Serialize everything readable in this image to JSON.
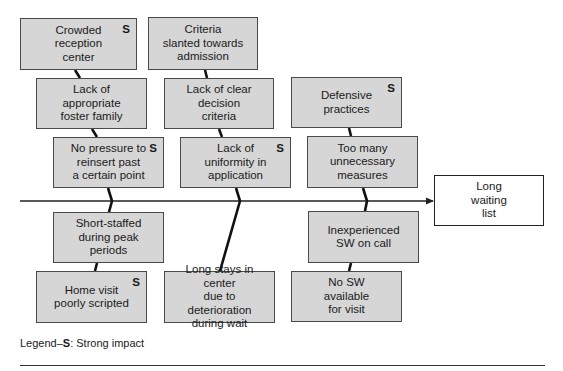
{
  "diagram": {
    "type": "fishbone",
    "effect": {
      "label": "Long\nwaiting\nlist",
      "x": 434,
      "y": 175,
      "w": 110,
      "h": 51
    },
    "causes": [
      {
        "id": "crowded",
        "label": "Crowded\nreception\ncenter",
        "strong": true,
        "x": 20,
        "y": 18,
        "w": 117,
        "h": 52
      },
      {
        "id": "criteria",
        "label": "Criteria\nslanted towards\nadmission",
        "strong": false,
        "x": 148,
        "y": 17,
        "w": 110,
        "h": 53
      },
      {
        "id": "lack-foster",
        "label": "Lack of\nappropriate\nfoster family",
        "strong": false,
        "x": 36,
        "y": 78,
        "w": 111,
        "h": 51
      },
      {
        "id": "lack-decision",
        "label": "Lack of clear\ndecision\ncriteria",
        "strong": false,
        "x": 164,
        "y": 78,
        "w": 110,
        "h": 51
      },
      {
        "id": "defensive",
        "label": "Defensive\npractices",
        "strong": true,
        "x": 291,
        "y": 77,
        "w": 111,
        "h": 51
      },
      {
        "id": "no-pressure",
        "label": "No pressure to\nreinsert past\na certain point",
        "strong": true,
        "x": 53,
        "y": 137,
        "w": 111,
        "h": 51
      },
      {
        "id": "lack-uniform",
        "label": "Lack of\nuniformity in\napplication",
        "strong": true,
        "x": 180,
        "y": 137,
        "w": 111,
        "h": 51
      },
      {
        "id": "too-many",
        "label": "Too many\nunnecessary\nmeasures",
        "strong": false,
        "x": 307,
        "y": 136,
        "w": 111,
        "h": 52
      },
      {
        "id": "short-staffed",
        "label": "Short-staffed\nduring peak\nperiods",
        "strong": false,
        "x": 53,
        "y": 212,
        "w": 111,
        "h": 51
      },
      {
        "id": "inexperienced",
        "label": "Inexperienced\nSW on call",
        "strong": false,
        "x": 308,
        "y": 211,
        "w": 111,
        "h": 52
      },
      {
        "id": "home-visit",
        "label": "Home visit\npoorly scripted",
        "strong": true,
        "x": 36,
        "y": 271,
        "w": 111,
        "h": 52
      },
      {
        "id": "long-stays",
        "label": "Long stays in center\ndue to deterioration\nduring wait",
        "strong": false,
        "x": 164,
        "y": 271,
        "w": 111,
        "h": 52
      },
      {
        "id": "no-sw",
        "label": "No SW\navailable\nfor visit",
        "strong": false,
        "x": 291,
        "y": 271,
        "w": 111,
        "h": 51
      }
    ],
    "strong_marker": "S",
    "spine": {
      "x1": 20,
      "y": 201,
      "x2": 433
    },
    "bones": [
      [
        [
          75,
          70
        ],
        [
          80,
          78
        ]
      ],
      [
        [
          92,
          129
        ],
        [
          97,
          137
        ]
      ],
      [
        [
          108,
          188
        ],
        [
          112,
          201
        ],
        [
          109,
          212
        ]
      ],
      [
        [
          97,
          263
        ],
        [
          95,
          271
        ]
      ],
      [
        [
          205,
          70
        ],
        [
          207,
          78
        ]
      ],
      [
        [
          219,
          129
        ],
        [
          222,
          137
        ]
      ],
      [
        [
          236,
          188
        ],
        [
          240,
          201
        ],
        [
          220,
          271
        ]
      ],
      [
        [
          349,
          128
        ],
        [
          351,
          136
        ]
      ],
      [
        [
          363,
          188
        ],
        [
          367,
          201
        ],
        [
          365,
          211
        ]
      ],
      [
        [
          351,
          263
        ],
        [
          349,
          271
        ]
      ]
    ]
  },
  "legend": {
    "prefix": "Legend–",
    "key": "S",
    "suffix": ": Strong impact"
  },
  "colors": {
    "box_fill": "#d6d6d6",
    "box_border": "#4a4a4a",
    "line": "#111111"
  }
}
